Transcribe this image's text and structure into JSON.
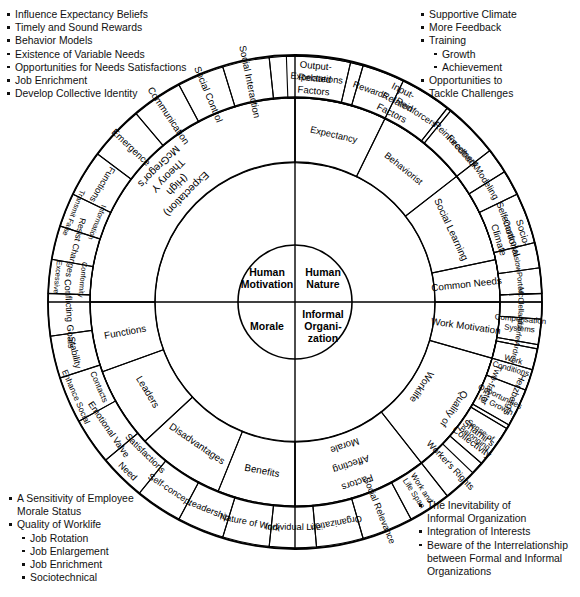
{
  "geometry": {
    "cx": 295,
    "cy": 302,
    "r_core": 57,
    "r_inner": 140,
    "r_outer": 205,
    "r_edge": 247
  },
  "colors": {
    "stroke": "#000000",
    "fill_outer": "#d8d8d8",
    "fill_inner": "#ffffff",
    "text": "#000000"
  },
  "notes": {
    "top_left": [
      {
        "text": "Influence Expectancy Beliefs",
        "level": 1
      },
      {
        "text": "Timely and Sound Rewards",
        "level": 1
      },
      {
        "text": "Behavior Models",
        "level": 1
      },
      {
        "text": "Existence of Variable Needs",
        "level": 1
      },
      {
        "text": "Opportunities for Needs Satisfactions",
        "level": 1
      },
      {
        "text": "Job Enrichment",
        "level": 1
      },
      {
        "text": "Develop Collective Identity",
        "level": 1
      }
    ],
    "top_right": [
      {
        "text": "Supportive Climate",
        "level": 1
      },
      {
        "text": "More Feedback",
        "level": 1
      },
      {
        "text": "Training",
        "level": 1
      },
      {
        "text": "Growth",
        "level": 2
      },
      {
        "text": "Achievement",
        "level": 2
      },
      {
        "text": "Opportunities to\nTackle Challenges",
        "level": 1
      }
    ],
    "bottom_left": [
      {
        "text": "A Sensitivity of Employee\nMorale Status",
        "level": 1
      },
      {
        "text": "Quality of Worklife",
        "level": 1
      },
      {
        "text": "Job Rotation",
        "level": 2
      },
      {
        "text": "Job Enlargement",
        "level": 2
      },
      {
        "text": "Job Enrichment",
        "level": 2
      },
      {
        "text": "Sociotechnical",
        "level": 2
      }
    ],
    "bottom_right": [
      {
        "text": "The Inevitability of\nInformal Organization",
        "level": 1
      },
      {
        "text": "Integration of Interests",
        "level": 1
      },
      {
        "text": "Beware of the Interrelationship\nbetween Formal and Informal\nOrganizations",
        "level": 1
      }
    ]
  },
  "core": [
    {
      "id": "human-motivation",
      "label": "Human\nMotivation",
      "quadrant": "top-left"
    },
    {
      "id": "human-nature",
      "label": "Human\nNature",
      "quadrant": "top-right"
    },
    {
      "id": "morale",
      "label": "Morale",
      "quadrant": "bottom-left"
    },
    {
      "id": "informal-organization",
      "label": "Informal\nOrgani-\nzation",
      "quadrant": "bottom-right"
    }
  ],
  "inner_ring": [
    {
      "label": "Expectancy",
      "a0": 270,
      "a1": 296,
      "size": 9.3,
      "mode": "radial"
    },
    {
      "label": "Behaviorist",
      "a0": 296,
      "a1": 322,
      "size": 9.3,
      "mode": "radial"
    },
    {
      "label": "Social Learning",
      "a0": 322,
      "a1": 348,
      "size": 9.8,
      "mode": "radial"
    },
    {
      "label": "Common Needs",
      "a0": 348,
      "a1": 360,
      "size": 9.8,
      "mode": "arc"
    },
    {
      "label": "Work Motivation",
      "a0": 0,
      "a1": 16,
      "size": 9.8,
      "mode": "arc"
    },
    {
      "label": "Quality of\nWorklife",
      "a0": 16,
      "a1": 52,
      "size": 9.8,
      "mode": "radial"
    },
    {
      "label": "Factors\nAffecting\nMorale",
      "a0": 52,
      "a1": 90,
      "size": 9.8,
      "mode": "radial"
    },
    {
      "label": "Benefits",
      "a0": 90,
      "a1": 112,
      "size": 9.8,
      "mode": "radial"
    },
    {
      "label": "Disadvantages",
      "a0": 112,
      "a1": 137,
      "size": 9.8,
      "mode": "radial"
    },
    {
      "label": "Leaders",
      "a0": 137,
      "a1": 160,
      "size": 9.8,
      "mode": "radial"
    },
    {
      "label": "Functions",
      "a0": 160,
      "a1": 180,
      "size": 9.8,
      "mode": "arc"
    },
    {
      "label": "McGregor's\nTheory Y\n(High\nExpectation)",
      "a0": 180,
      "a1": 270,
      "size": 10.5,
      "mode": "radial"
    }
  ],
  "outer_ring": [
    {
      "label": "Expectations",
      "a0": 268,
      "a1": 283,
      "size": 9.2,
      "mode": "radial"
    },
    {
      "label": "Rewards",
      "a0": 283,
      "a1": 296,
      "size": 9.2,
      "mode": "radial"
    },
    {
      "label": "Reinforcers",
      "a0": 296,
      "a1": 309,
      "size": 9.2,
      "mode": "radial"
    },
    {
      "label": "Reinforcement",
      "a0": 309,
      "a1": 322,
      "size": 9.2,
      "mode": "radial"
    },
    {
      "label": "Modeling",
      "a0": 322,
      "a1": 334,
      "size": 9.2,
      "mode": "radial"
    },
    {
      "label": "Self-Control",
      "a0": 334,
      "a1": 346,
      "size": 9.2,
      "mode": "radial"
    },
    {
      "label": "Maslow",
      "a0": 346,
      "a1": 352,
      "size": 7.6,
      "mode": "radial"
    },
    {
      "label": "Porter",
      "a0": 352,
      "a1": 358,
      "size": 7.6,
      "mode": "radial"
    },
    {
      "label": "McClelland",
      "a0": 358,
      "a1": 364,
      "size": 7.6,
      "mode": "radial"
    },
    {
      "label": "Alderfer",
      "a0": 364,
      "a1": 370,
      "size": 7.6,
      "mode": "radial"
    },
    {
      "label": "Ardrey",
      "a0": 370,
      "a1": 376,
      "size": 7.6,
      "mode": "radial"
    },
    {
      "label": "Herzberg's\nTwo-factor",
      "a0": 376,
      "a1": 390,
      "size": 9.2,
      "mode": "radial"
    },
    {
      "label": "Shamir's\nCollectivity",
      "a0": 390,
      "a1": 404,
      "size": 9.6,
      "mode": "arc"
    },
    {
      "label": "Compensation\nSystems",
      "a0": 0,
      "a1": 11,
      "size": 8.0,
      "mode": "arc"
    },
    {
      "label": "Work\nConditions",
      "a0": 11,
      "a1": 21,
      "size": 8.0,
      "mode": "arc"
    },
    {
      "label": "Opportunities\nfor Growth",
      "a0": 21,
      "a1": 31,
      "size": 8.0,
      "mode": "arc"
    },
    {
      "label": "Sense of\nBelonging",
      "a0": 31,
      "a1": 41,
      "size": 8.0,
      "mode": "arc"
    },
    {
      "label": "Worker's Rights",
      "a0": 41,
      "a1": 52,
      "size": 9.2,
      "mode": "arc"
    },
    {
      "label": "Work and\nLife Span",
      "a0": 52,
      "a1": 62,
      "size": 8.0,
      "mode": "arc"
    },
    {
      "label": "Social Relevance",
      "a0": 62,
      "a1": 74,
      "size": 9.2,
      "mode": "arc"
    },
    {
      "label": "Organization",
      "a0": 74,
      "a1": 85,
      "size": 9.2,
      "mode": "radial"
    },
    {
      "label": "Individual Life",
      "a0": 85,
      "a1": 96,
      "size": 9.2,
      "mode": "radial"
    },
    {
      "label": "Nature of Work",
      "a0": 96,
      "a1": 107,
      "size": 9.2,
      "mode": "radial"
    },
    {
      "label": "Leadership",
      "a0": 107,
      "a1": 118,
      "size": 9.2,
      "mode": "radial"
    },
    {
      "label": "Self-concept",
      "a0": 118,
      "a1": 129,
      "size": 9.2,
      "mode": "radial"
    },
    {
      "label": "Need\nSatisfactions",
      "a0": 129,
      "a1": 140,
      "size": 9.2,
      "mode": "radial"
    },
    {
      "label": "Emotional Valve",
      "a0": 140,
      "a1": 151,
      "size": 9.2,
      "mode": "radial"
    },
    {
      "label": "Enhance Social\nContacts",
      "a0": 151,
      "a1": 162,
      "size": 8.4,
      "mode": "radial"
    },
    {
      "label": "Stability",
      "a0": 162,
      "a1": 172,
      "size": 9.2,
      "mode": "radial"
    },
    {
      "label": "Conflicting Goals",
      "a0": 172,
      "a1": 182,
      "size": 9.2,
      "mode": "radial"
    },
    {
      "label": "Excessive\nConformity",
      "a0": 182,
      "a1": 190,
      "size": 7.4,
      "mode": "radial"
    },
    {
      "label": "Resist Changes",
      "a0": 190,
      "a1": 198,
      "size": 8.6,
      "mode": "radial"
    },
    {
      "label": "Transmit False\nInformation",
      "a0": 198,
      "a1": 206,
      "size": 7.4,
      "mode": "radial"
    },
    {
      "label": "Functions",
      "a0": 206,
      "a1": 217,
      "size": 9.2,
      "mode": "radial"
    },
    {
      "label": "Emergence",
      "a0": 217,
      "a1": 230,
      "size": 9.6,
      "mode": "arc"
    },
    {
      "label": "Communication",
      "a0": 230,
      "a1": 242,
      "size": 9.6,
      "mode": "arc"
    },
    {
      "label": "Social Control",
      "a0": 242,
      "a1": 253,
      "size": 9.6,
      "mode": "arc"
    },
    {
      "label": "Social Interaction",
      "a0": 253,
      "a1": 264,
      "size": 9.6,
      "mode": "arc"
    },
    {
      "label": "Output-\nRelated\nFactors",
      "a0": 264,
      "a1": 286,
      "size": 9.6,
      "mode": "radial"
    },
    {
      "label": "Input-\nRelated\nFactors",
      "a0": 286,
      "a1": 308,
      "size": 9.6,
      "mode": "radial"
    },
    {
      "label": "Feedback",
      "a0": 308,
      "a1": 328,
      "size": 9.6,
      "mode": "radial"
    },
    {
      "label": "Socio-\nemotional\nClimate",
      "a0": 328,
      "a1": 358,
      "size": 9.6,
      "mode": "radial"
    }
  ]
}
